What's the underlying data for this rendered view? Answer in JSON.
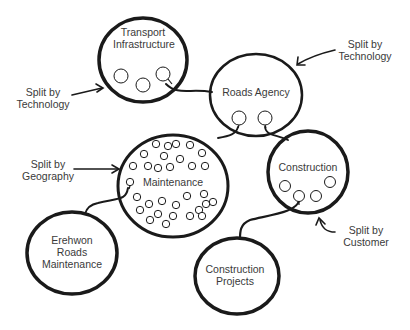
{
  "diagram": {
    "nodes": [
      {
        "id": "transport",
        "label_lines": [
          "Transport",
          "Infrastructure"
        ]
      },
      {
        "id": "roads",
        "label_lines": [
          "Roads Agency"
        ]
      },
      {
        "id": "maintenance",
        "label_lines": [
          "Maintenance"
        ]
      },
      {
        "id": "construction",
        "label_lines": [
          "Construction"
        ]
      },
      {
        "id": "erehwon",
        "label_lines": [
          "Erehwon",
          "Roads",
          "Maintenance"
        ]
      },
      {
        "id": "projects",
        "label_lines": [
          "Construction",
          "Projects"
        ]
      }
    ],
    "annotations": [
      {
        "id": "tech-left",
        "lines": [
          "Split by",
          "Technology"
        ],
        "points_to": "transport"
      },
      {
        "id": "tech-right",
        "lines": [
          "Split by",
          "Technology"
        ],
        "points_to": "roads"
      },
      {
        "id": "geo",
        "lines": [
          "Split by",
          "Geography"
        ],
        "points_to": "maintenance"
      },
      {
        "id": "customer",
        "lines": [
          "Split by",
          "Customer"
        ],
        "points_to": "construction"
      }
    ],
    "edges": [
      {
        "from": "transport",
        "to": "roads"
      },
      {
        "from": "roads",
        "to": "maintenance"
      },
      {
        "from": "roads",
        "to": "construction"
      },
      {
        "from": "maintenance",
        "to": "erehwon"
      },
      {
        "from": "construction",
        "to": "projects"
      }
    ],
    "stroke_color": "#1a1a1a",
    "text_color": "#3a3a3a"
  }
}
